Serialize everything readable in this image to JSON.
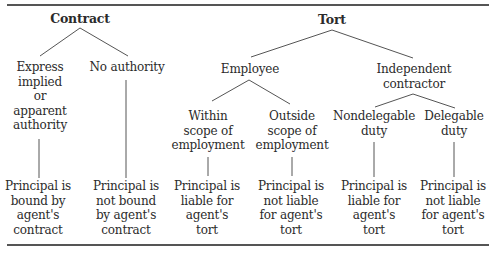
{
  "diagram": {
    "roots": {
      "contract": "Contract",
      "tort": "Tort"
    },
    "contract_branches": {
      "authority": [
        "Express",
        "implied",
        "or",
        "apparent",
        "authority"
      ],
      "no_authority": [
        "No authority"
      ]
    },
    "tort_branches": {
      "employee": [
        "Employee"
      ],
      "independent_contractor": [
        "Independent",
        "contractor"
      ]
    },
    "employee_branches": {
      "within": [
        "Within",
        "scope of",
        "employment"
      ],
      "outside": [
        "Outside",
        "scope of",
        "employment"
      ]
    },
    "contractor_branches": {
      "nondelegable": [
        "Nondelegable",
        "duty"
      ],
      "delegable": [
        "Delegable",
        "duty"
      ]
    },
    "outcomes": [
      [
        "Principal is",
        "bound by",
        "agent's",
        "contract"
      ],
      [
        "Principal is",
        "not bound",
        "by agent's",
        "contract"
      ],
      [
        "Principal is",
        "liable for",
        "agent's",
        "tort"
      ],
      [
        "Principal is",
        "not liable",
        "for agent's",
        "tort"
      ],
      [
        "Principal is",
        "liable for",
        "agent's",
        "tort"
      ],
      [
        "Principal is",
        "not liable",
        "for agent's",
        "tort"
      ]
    ],
    "colors": {
      "text": "#2b2b2b",
      "lines": "#555555"
    }
  }
}
